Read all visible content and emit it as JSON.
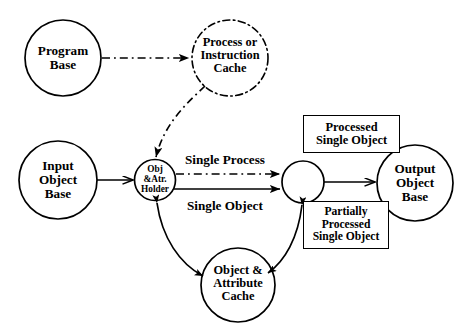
{
  "diagram": {
    "type": "data-flow-diagram",
    "background_color": "#ffffff",
    "stroke_color": "#000000",
    "nodes": {
      "program_base": {
        "shape": "circle",
        "border_style": "solid",
        "lines": [
          "Program",
          "Base"
        ]
      },
      "process_or_instruction_cache": {
        "shape": "circle",
        "border_style": "dash-dot",
        "lines": [
          "Process or",
          "Instruction",
          "Cache"
        ]
      },
      "input_object_base": {
        "shape": "circle",
        "border_style": "solid",
        "lines": [
          "Input",
          "Object",
          "Base"
        ]
      },
      "obj_atr_holder": {
        "shape": "circle",
        "border_style": "solid",
        "lines": [
          "Obj",
          "&Atr.",
          "Holder"
        ]
      },
      "process_node": {
        "shape": "circle",
        "border_style": "solid",
        "lines": []
      },
      "output_object_base": {
        "shape": "circle",
        "border_style": "solid",
        "lines": [
          "Output",
          "Object",
          "Base"
        ]
      },
      "object_attribute_cache": {
        "shape": "circle",
        "border_style": "solid",
        "lines": [
          "Object &",
          "Attribute",
          "Cache"
        ]
      }
    },
    "boxes": {
      "processed_single_object": {
        "shape": "rectangle",
        "lines": [
          "Processed",
          "Single Object"
        ]
      },
      "partially_processed_single_object": {
        "shape": "rectangle",
        "lines": [
          "Partially",
          "Processed",
          "Single Object"
        ]
      }
    },
    "edge_labels": {
      "single_process": "Single Process",
      "single_object": "Single Object"
    },
    "edges": [
      {
        "from": "program_base",
        "to": "process_or_instruction_cache",
        "style": "dash-dot",
        "arrow": "single"
      },
      {
        "from": "process_or_instruction_cache",
        "to": "obj_atr_holder",
        "style": "dash-dot",
        "arrow": "single"
      },
      {
        "from": "input_object_base",
        "to": "obj_atr_holder",
        "style": "solid",
        "arrow": "single"
      },
      {
        "from": "obj_atr_holder",
        "to": "process_node",
        "style": "dash-dot",
        "arrow": "single",
        "label": "Single Process"
      },
      {
        "from": "obj_atr_holder",
        "to": "process_node",
        "style": "solid",
        "arrow": "single",
        "label": "Single Object"
      },
      {
        "from": "process_node",
        "to": "output_object_base",
        "style": "solid",
        "arrow": "single",
        "label": "Processed Single Object"
      },
      {
        "from": "obj_atr_holder",
        "to": "object_attribute_cache",
        "style": "solid",
        "arrow": "double"
      },
      {
        "from": "object_attribute_cache",
        "to": "process_node",
        "style": "solid",
        "arrow": "double",
        "label": "Partially Processed Single Object"
      }
    ]
  }
}
